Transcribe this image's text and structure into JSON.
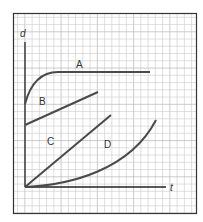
{
  "chart_data": {
    "type": "line",
    "title": "",
    "xlabel": "t",
    "ylabel": "d",
    "grid": true,
    "legend": "inline labels",
    "series": [
      {
        "name": "A",
        "description": "rises quickly then levels off to constant d",
        "points": [
          [
            0,
            3.8
          ],
          [
            1,
            5.5
          ],
          [
            2,
            6.1
          ],
          [
            3,
            6.2
          ],
          [
            17,
            6.2
          ]
        ]
      },
      {
        "name": "B",
        "description": "straight line starting above zero, gentle positive slope",
        "points": [
          [
            0,
            3.4
          ],
          [
            10,
            5.0
          ]
        ]
      },
      {
        "name": "C",
        "description": "straight line through origin, steeper slope",
        "points": [
          [
            0,
            0
          ],
          [
            12,
            10
          ]
        ]
      },
      {
        "name": "D",
        "description": "curve through origin, increasing slope",
        "points": [
          [
            0,
            0
          ],
          [
            6,
            1.2
          ],
          [
            12,
            3.5
          ],
          [
            18,
            9
          ]
        ]
      }
    ]
  },
  "labels": {
    "y_axis": "d",
    "x_axis": "t",
    "A": "A",
    "B": "B",
    "C": "C",
    "D": "D"
  },
  "colors": {
    "grid": "#c9c9c9",
    "grid_major": "#a9a9a9",
    "curve": "#4a4a4a",
    "axis": "#222222",
    "border": "#333333"
  }
}
